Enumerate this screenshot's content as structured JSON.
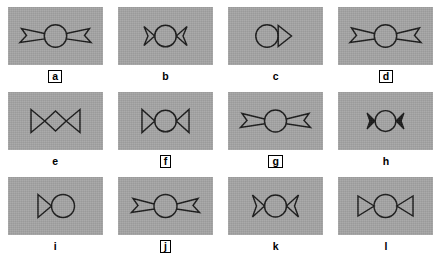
{
  "figure": {
    "title": "",
    "background_color": "#ffffff",
    "panel_color": "#a5a5a5",
    "stroke_color": "#1a1a1a",
    "columns": 4,
    "rows": 3
  },
  "panels": [
    {
      "label": "a",
      "boxed": true,
      "symbol": "circle-with-two-concave-darts-wide",
      "description": "open circle flanked by two long outward concave arrow/dart shapes connected by straight lines"
    },
    {
      "label": "b",
      "boxed": false,
      "symbol": "circle-with-two-small-concave-darts",
      "description": "open circle flanked immediately by two small concave-back darts"
    },
    {
      "label": "c",
      "boxed": false,
      "symbol": "circle-with-single-right-triangle",
      "description": "open circle on the left with one straight-backed triangle pointing left on the right"
    },
    {
      "label": "d",
      "boxed": true,
      "symbol": "circle-with-two-concave-darts-wide",
      "description": "open circle flanked by two long outward concave dart shapes on straight stems"
    },
    {
      "label": "e",
      "boxed": false,
      "symbol": "diamond-bowtie",
      "description": "two straight-backed triangles meeting a central diamond instead of a circle"
    },
    {
      "label": "f",
      "boxed": true,
      "symbol": "circle-bowtie-straight",
      "description": "open circle flanked by two straight-backed triangles forming a bowtie"
    },
    {
      "label": "g",
      "boxed": true,
      "symbol": "circle-with-two-concave-darts-wide",
      "description": "open circle flanked by two long outward concave dart shapes"
    },
    {
      "label": "h",
      "boxed": false,
      "symbol": "circle-with-two-small-filled-darts",
      "description": "open circle with two small filled dart shapes tight against its sides"
    },
    {
      "label": "i",
      "boxed": false,
      "symbol": "triangle-and-circle",
      "description": "single triangle pointing right joined to an open circle, infinity-like"
    },
    {
      "label": "j",
      "boxed": true,
      "symbol": "circle-with-two-concave-darts-wide",
      "description": "open circle flanked by two outward concave dart shapes on stems"
    },
    {
      "label": "k",
      "boxed": false,
      "symbol": "circle-with-two-small-concave-darts",
      "description": "open circle flanked immediately by two concave-back darts"
    },
    {
      "label": "l",
      "boxed": false,
      "symbol": "circle-bowtie-straight",
      "description": "open circle flanked by two straight-backed triangles forming a bowtie"
    }
  ]
}
